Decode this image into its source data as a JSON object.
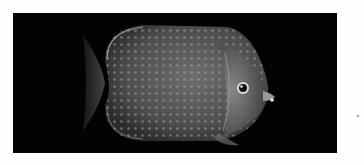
{
  "image": {
    "subject": "butterflyfish",
    "description": "Grayscale photograph of a butterflyfish with a spotted body on a black background",
    "colors": {
      "page_background": "#fdfdfd",
      "photo_background": "#030303",
      "fish_body": "#5a5a5a",
      "fish_spots": "#9a9a9a",
      "fin_edge": "#c8c8c8"
    }
  }
}
